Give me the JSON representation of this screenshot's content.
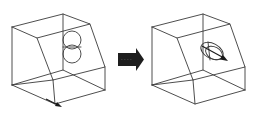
{
  "diagram": {
    "title": "",
    "colors": {
      "line": "#3a3a3a",
      "arrow": "#1e1e1e",
      "background": "#ffffff"
    },
    "panels": [
      {
        "id": "before",
        "label": "",
        "feature": "two stacked circles on chamfer face",
        "vector": "arrow along front-bottom edge"
      },
      {
        "id": "after",
        "label": "",
        "feature": "tilted ellipse on chamfer face",
        "vector": "arrow through ellipse center along face normal"
      }
    ],
    "transition": {
      "icon": "right-arrow-icon",
      "label": ""
    }
  }
}
